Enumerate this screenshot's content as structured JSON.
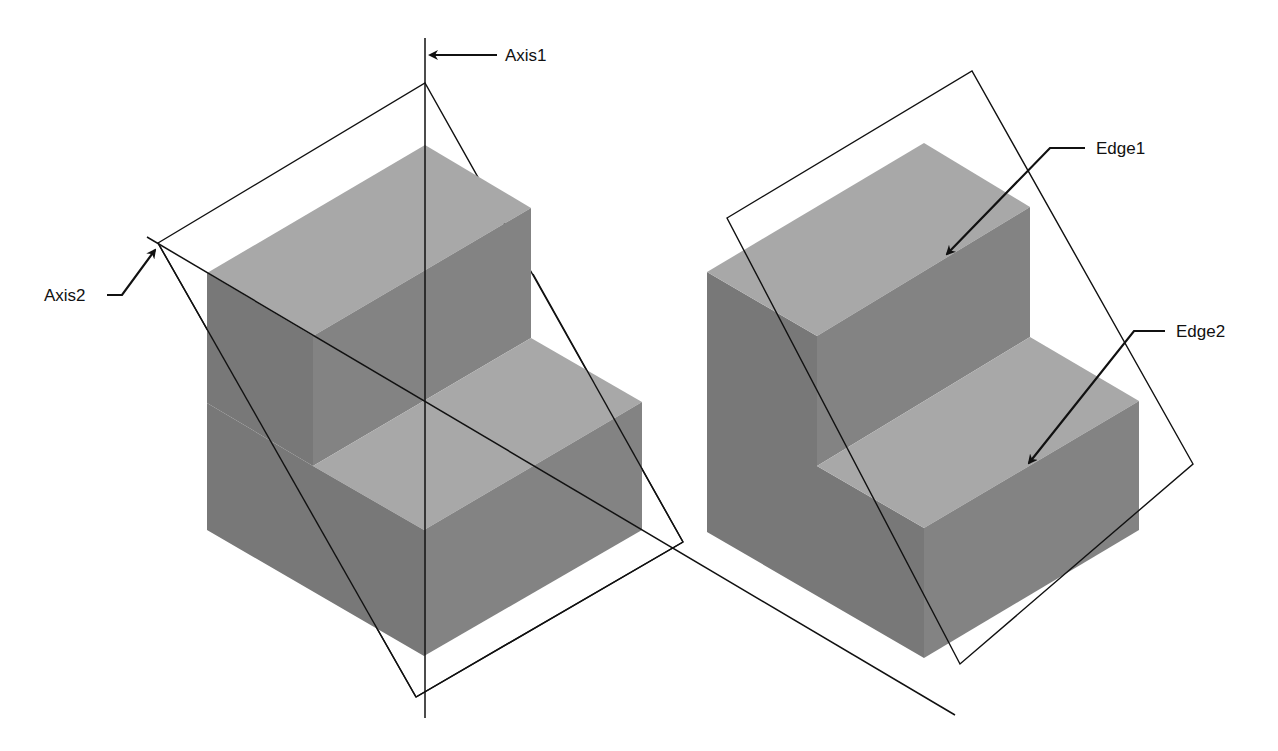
{
  "figure": {
    "colors": {
      "background": "#ffffff",
      "top_face": "#a6a6a6",
      "left_face": "#7a7a7a",
      "right_face": "#858585",
      "plane_fill": "#e4e4e4",
      "line": "#111111"
    }
  },
  "left_view": {
    "labels": {
      "axis1": "Axis1",
      "axis2": "Axis2"
    }
  },
  "right_view": {
    "labels": {
      "edge1": "Edge1",
      "edge2": "Edge2"
    }
  }
}
